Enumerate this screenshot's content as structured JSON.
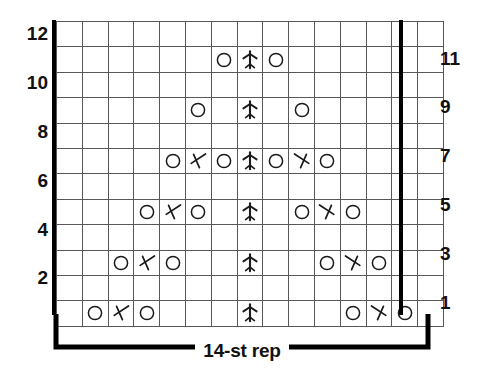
{
  "chart": {
    "columns": 15,
    "rows": 12,
    "repeat_columns": 14,
    "repeat_label": "14-st rep",
    "left_row_numbers": [
      "12",
      "10",
      "8",
      "6",
      "4",
      "2"
    ],
    "right_row_numbers": [
      "11",
      "9",
      "7",
      "5",
      "3",
      "1"
    ],
    "colors": {
      "grid_line": "#58585a",
      "heavy_line": "#000000",
      "symbol": "#1a1a1a",
      "background": "#ffffff"
    },
    "symbol_legend": [
      {
        "key": "o",
        "name": "yarn-over",
        "glyph": "circle"
      },
      {
        "key": "lt",
        "name": "left-slant-decrease",
        "glyph": "left-leaning-chevron"
      },
      {
        "key": "rt",
        "name": "right-slant-decrease",
        "glyph": "right-leaning-chevron"
      },
      {
        "key": "cd",
        "name": "centered-double-decrease",
        "glyph": "vertical-stem-with-wings"
      },
      {
        "key": "",
        "name": "empty-knit-stitch",
        "glyph": "blank"
      }
    ],
    "cells": [
      {
        "row": 12,
        "side": "WS",
        "values": [
          "",
          "",
          "",
          "",
          "",
          "",
          "",
          "",
          "",
          "",
          "",
          "",
          "",
          "",
          ""
        ]
      },
      {
        "row": 11,
        "side": "RS",
        "values": [
          "",
          "",
          "",
          "",
          "",
          "",
          "o",
          "cd",
          "o",
          "",
          "",
          "",
          "",
          "",
          ""
        ]
      },
      {
        "row": 10,
        "side": "WS",
        "values": [
          "",
          "",
          "",
          "",
          "",
          "",
          "",
          "",
          "",
          "",
          "",
          "",
          "",
          "",
          ""
        ]
      },
      {
        "row": 9,
        "side": "RS",
        "values": [
          "",
          "",
          "",
          "",
          "",
          "o",
          "",
          "cd",
          "",
          "o",
          "",
          "",
          "",
          "",
          ""
        ]
      },
      {
        "row": 8,
        "side": "WS",
        "values": [
          "",
          "",
          "",
          "",
          "",
          "",
          "",
          "",
          "",
          "",
          "",
          "",
          "",
          "",
          ""
        ]
      },
      {
        "row": 7,
        "side": "RS",
        "values": [
          "",
          "",
          "",
          "",
          "o",
          "lt",
          "o",
          "cd",
          "o",
          "rt",
          "o",
          "",
          "",
          "",
          ""
        ]
      },
      {
        "row": 6,
        "side": "WS",
        "values": [
          "",
          "",
          "",
          "",
          "",
          "",
          "",
          "",
          "",
          "",
          "",
          "",
          "",
          "",
          ""
        ]
      },
      {
        "row": 5,
        "side": "RS",
        "values": [
          "",
          "",
          "",
          "o",
          "lt",
          "o",
          "",
          "cd",
          "",
          "o",
          "rt",
          "o",
          "",
          "",
          ""
        ]
      },
      {
        "row": 4,
        "side": "WS",
        "values": [
          "",
          "",
          "",
          "",
          "",
          "",
          "",
          "",
          "",
          "",
          "",
          "",
          "",
          "",
          ""
        ]
      },
      {
        "row": 3,
        "side": "RS",
        "values": [
          "",
          "",
          "o",
          "lt",
          "o",
          "",
          "",
          "cd",
          "",
          "",
          "o",
          "rt",
          "o",
          "",
          ""
        ]
      },
      {
        "row": 2,
        "side": "WS",
        "values": [
          "",
          "",
          "",
          "",
          "",
          "",
          "",
          "",
          "",
          "",
          "",
          "",
          "",
          "",
          ""
        ]
      },
      {
        "row": 1,
        "side": "RS",
        "values": [
          "",
          "o",
          "lt",
          "o",
          "",
          "",
          "",
          "cd",
          "",
          "",
          "",
          "o",
          "rt",
          "o",
          ""
        ]
      }
    ]
  }
}
